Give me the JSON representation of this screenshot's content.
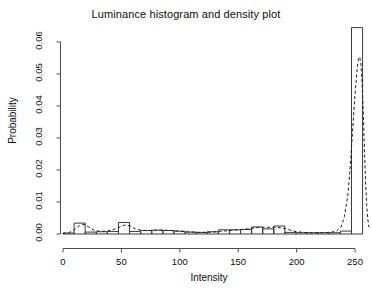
{
  "chart_data": {
    "type": "bar",
    "title": "Luminance histogram and density plot",
    "xlabel": "Intensity",
    "ylabel": "Probability",
    "xlim": [
      -2,
      262
    ],
    "ylim": [
      0,
      0.0655
    ],
    "grid": false,
    "legend": null,
    "xticks": [
      0,
      50,
      100,
      150,
      200,
      250
    ],
    "xtick_labels": [
      "0",
      "50",
      "100",
      "150",
      "200",
      "250"
    ],
    "yticks": [
      0.0,
      0.01,
      0.02,
      0.03,
      0.04,
      0.05,
      0.06
    ],
    "ytick_labels": [
      "0.00",
      "0.01",
      "0.02",
      "0.03",
      "0.04",
      "0.05",
      "0.06"
    ],
    "bin_width": 9.5,
    "bin_edges": [
      0,
      9.5,
      19,
      28.5,
      38,
      47.5,
      57,
      66.5,
      76,
      85.5,
      95,
      104.5,
      114,
      123.5,
      133,
      142.5,
      152,
      161.5,
      171,
      180.5,
      190,
      199.5,
      209,
      218.5,
      228,
      237.5,
      247,
      256.5
    ],
    "series": [
      {
        "name": "histogram",
        "kind": "bar",
        "categories": [
          4.75,
          14.25,
          23.75,
          33.25,
          42.75,
          52.25,
          61.75,
          71.25,
          80.75,
          90.25,
          99.75,
          109.25,
          118.75,
          128.25,
          137.75,
          147.25,
          156.75,
          166.25,
          175.75,
          185.25,
          194.75,
          204.25,
          213.75,
          223.25,
          232.75,
          242.25,
          251.75
        ],
        "values": [
          0.0003,
          0.0034,
          0.0006,
          0.0007,
          0.0008,
          0.0036,
          0.0008,
          0.0011,
          0.0012,
          0.0011,
          0.0009,
          0.0006,
          0.0005,
          0.0007,
          0.0013,
          0.0013,
          0.0014,
          0.0022,
          0.0016,
          0.0025,
          0.0005,
          0.0004,
          0.0004,
          0.0004,
          0.0004,
          0.0009,
          0.0645
        ]
      },
      {
        "name": "density",
        "kind": "line",
        "style": "dashed",
        "x": [
          0,
          5,
          10,
          14,
          18,
          22,
          27,
          32,
          38,
          44,
          50,
          53,
          57,
          62,
          68,
          74,
          80,
          86,
          92,
          98,
          104,
          110,
          116,
          122,
          128,
          134,
          140,
          146,
          152,
          158,
          164,
          170,
          176,
          182,
          188,
          194,
          200,
          206,
          212,
          218,
          224,
          230,
          234,
          238,
          241,
          244,
          246,
          248,
          250,
          252,
          253,
          254,
          255,
          256,
          257,
          258,
          259,
          260,
          261,
          262
        ],
        "y": [
          0.0002,
          0.0004,
          0.0014,
          0.0026,
          0.003,
          0.0022,
          0.0011,
          0.0008,
          0.0009,
          0.0015,
          0.0024,
          0.0028,
          0.0026,
          0.0016,
          0.0011,
          0.0011,
          0.0012,
          0.0012,
          0.0011,
          0.0009,
          0.0007,
          0.0006,
          0.0005,
          0.0005,
          0.0006,
          0.0008,
          0.001,
          0.0012,
          0.0014,
          0.0016,
          0.0019,
          0.0021,
          0.0021,
          0.0021,
          0.0019,
          0.0013,
          0.0007,
          0.0005,
          0.0004,
          0.0004,
          0.0004,
          0.0006,
          0.0009,
          0.0022,
          0.0055,
          0.0125,
          0.0215,
          0.0325,
          0.0435,
          0.0522,
          0.0548,
          0.0553,
          0.0535,
          0.0478,
          0.0385,
          0.0272,
          0.0168,
          0.0092,
          0.0045,
          0.0021
        ]
      }
    ]
  },
  "axes": {
    "y_tick_text": [
      "0.00",
      "0.01",
      "0.02",
      "0.03",
      "0.04",
      "0.05",
      "0.06"
    ],
    "x_tick_text": [
      "0",
      "50",
      "100",
      "150",
      "200",
      "250"
    ]
  }
}
